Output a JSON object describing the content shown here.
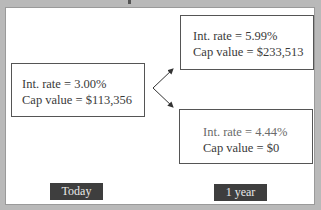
{
  "diagram": {
    "type": "binomial-tree",
    "nodes": [
      {
        "id": "today",
        "rate_label": "Int. rate = 3.00%",
        "cap_label": "Cap value = $113,356"
      },
      {
        "id": "up",
        "rate_label": "Int. rate = 5.99%",
        "cap_label": "Cap value = $233,513"
      },
      {
        "id": "down",
        "rate_label": "Int. rate = 4.44%",
        "cap_label": "Cap value = $0"
      }
    ],
    "edges": [
      {
        "from": "today",
        "to": "up"
      },
      {
        "from": "today",
        "to": "down"
      }
    ],
    "time_labels": {
      "today": "Today",
      "one_year": "1 year"
    }
  },
  "colors": {
    "background": "#b9b9b9",
    "panel": "#ffffff",
    "box_border": "#555555",
    "label_bg": "#3e3e3e",
    "label_text": "#e8e8e8"
  }
}
